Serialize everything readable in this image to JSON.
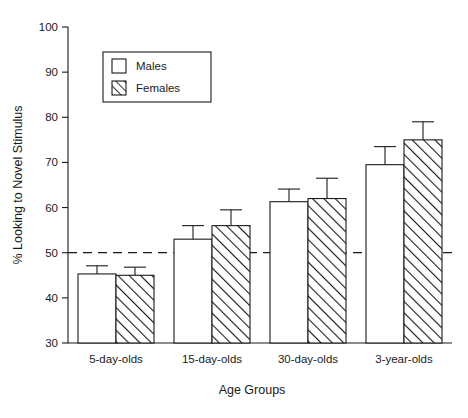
{
  "chart_data": {
    "type": "bar",
    "title": "",
    "xlabel": "Age Groups",
    "ylabel": "% Looking to Novel Stimulus",
    "categories": [
      "5-day-olds",
      "15-day-olds",
      "30-day-olds",
      "3-year-olds"
    ],
    "ylim": [
      30,
      100
    ],
    "yticks": [
      30,
      40,
      50,
      60,
      70,
      80,
      90,
      100
    ],
    "ytick_labels": [
      "30",
      "40",
      "50",
      "60",
      "70",
      "80",
      "90",
      "100"
    ],
    "grid": false,
    "legend_position": "upper-left-inside",
    "reference_line": {
      "value": 50,
      "style": "dashed",
      "label": "chance level 50%"
    },
    "series": [
      {
        "name": "Males",
        "fill": "white",
        "pattern": "none",
        "values": [
          45.3,
          53.0,
          61.3,
          69.5
        ],
        "errors": [
          1.8,
          3.0,
          2.8,
          4.0
        ]
      },
      {
        "name": "Females",
        "fill": "white",
        "pattern": "diagonal-hatch",
        "values": [
          45.0,
          56.0,
          62.0,
          75.0
        ],
        "errors": [
          1.8,
          3.5,
          4.5,
          4.0
        ]
      }
    ]
  },
  "legend": {
    "entries": [
      {
        "label": "Males",
        "swatch": "empty-square-swatch"
      },
      {
        "label": "Females",
        "swatch": "hatched-square-swatch"
      }
    ]
  },
  "axes": {
    "y_title": "% Looking to Novel Stimulus",
    "x_title": "Age Groups"
  }
}
